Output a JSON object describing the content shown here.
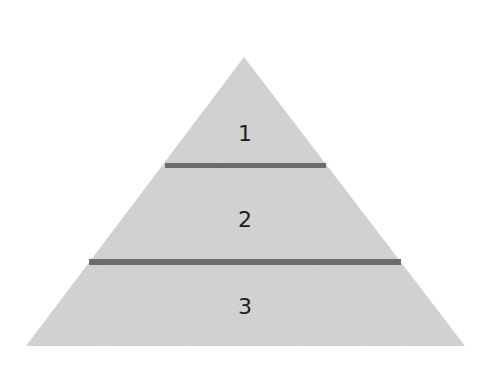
{
  "diagram": {
    "type": "pyramid",
    "colors": {
      "fill": "#d5d5d5",
      "divider": "#6b6b6b",
      "label": "#1e1e1e",
      "background": "#ffffff"
    },
    "tiers": [
      {
        "label": "1",
        "position": "top"
      },
      {
        "label": "2",
        "position": "middle"
      },
      {
        "label": "3",
        "position": "bottom"
      }
    ]
  }
}
